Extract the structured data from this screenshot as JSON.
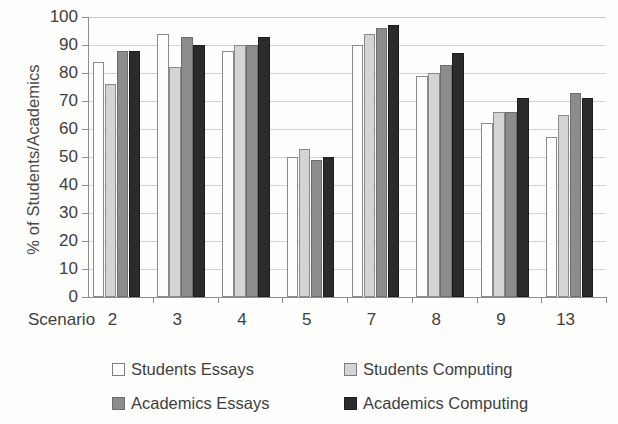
{
  "chart_data": {
    "type": "bar",
    "title": "",
    "subtitle": "",
    "xlabel": "Scenario",
    "ylabel": "% of Students/Academics",
    "categories": [
      "2",
      "3",
      "4",
      "5",
      "7",
      "8",
      "9",
      "13"
    ],
    "ylim": [
      0,
      100
    ],
    "y_ticks": [
      0,
      10,
      20,
      30,
      40,
      50,
      60,
      70,
      80,
      90,
      100
    ],
    "y_tick_labels": [
      "0",
      "10",
      "20",
      "30",
      "40",
      "50",
      "60",
      "70",
      "80",
      "90",
      "100"
    ],
    "grid": true,
    "grid_axis": "y",
    "legend_position": "bottom",
    "legend_columns": 2,
    "series": [
      {
        "name": "Students Essays",
        "color": "#fdfdfd",
        "edge_color": "#8a8a8a",
        "values": [
          84,
          94,
          88,
          50,
          90,
          79,
          62,
          57
        ]
      },
      {
        "name": "Students Computing",
        "color": "#d4d4d4",
        "edge_color": "#8a8a8a",
        "values": [
          76,
          82,
          90,
          53,
          94,
          80,
          66,
          65
        ]
      },
      {
        "name": "Academics Essays",
        "color": "#8c8c8c",
        "edge_color": "#6d6d6d",
        "values": [
          88,
          93,
          90,
          49,
          96,
          83,
          66,
          73
        ]
      },
      {
        "name": "Academics Computing",
        "color": "#2b2b2b",
        "edge_color": "#1d1d1d",
        "values": [
          88,
          90,
          93,
          50,
          97,
          87,
          71,
          71
        ]
      }
    ]
  },
  "axis": {
    "x_caption": "Scenario"
  }
}
